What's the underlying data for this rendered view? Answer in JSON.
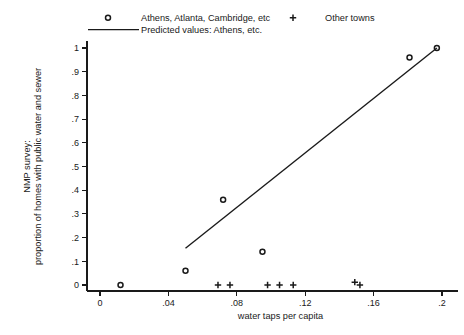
{
  "chart_data": {
    "type": "scatter",
    "title": "",
    "xlabel": "water taps per capita",
    "ylabel_line1": "NMP survey:",
    "ylabel_line2": "proportion of homes with public water and sewer",
    "xlim": [
      0,
      0.21
    ],
    "ylim": [
      0,
      1.05
    ],
    "xticks": [
      0,
      0.04,
      0.08,
      0.12,
      0.16,
      0.2
    ],
    "xticklabels": [
      "0",
      ".04",
      ".08",
      ".12",
      ".16",
      ".2"
    ],
    "yticks": [
      0,
      0.1,
      0.2,
      0.3,
      0.4,
      0.5,
      0.6,
      0.7,
      0.8,
      0.9,
      1
    ],
    "yticklabels": [
      "0",
      ".1",
      ".2",
      ".3",
      ".4",
      ".5",
      ".6",
      ".7",
      ".8",
      ".9",
      "1"
    ],
    "grid": false,
    "legend_position": "top",
    "series": [
      {
        "name": "Athens, Atlanta, Cambridge, etc",
        "marker": "circle",
        "points": [
          {
            "x": 0.012,
            "y": 0.0
          },
          {
            "x": 0.05,
            "y": 0.06
          },
          {
            "x": 0.072,
            "y": 0.36
          },
          {
            "x": 0.095,
            "y": 0.14
          },
          {
            "x": 0.181,
            "y": 0.96
          },
          {
            "x": 0.197,
            "y": 1.0
          }
        ]
      },
      {
        "name": "Other towns",
        "marker": "plus",
        "points": [
          {
            "x": 0.069,
            "y": 0.0
          },
          {
            "x": 0.076,
            "y": 0.0
          },
          {
            "x": 0.098,
            "y": 0.0
          },
          {
            "x": 0.105,
            "y": 0.0
          },
          {
            "x": 0.113,
            "y": 0.0
          },
          {
            "x": 0.149,
            "y": 0.012
          },
          {
            "x": 0.152,
            "y": 0.0
          }
        ]
      },
      {
        "name": "Predicted values: Athens, etc.",
        "marker": "line",
        "points": [
          {
            "x": 0.05,
            "y": 0.155
          },
          {
            "x": 0.197,
            "y": 1.0
          }
        ]
      }
    ]
  },
  "legend": {
    "entries": [
      {
        "label": "Athens, Atlanta, Cambridge, etc",
        "marker": "circle"
      },
      {
        "label": "Other towns",
        "marker": "plus"
      },
      {
        "label": "Predicted values: Athens, etc.",
        "marker": "line"
      }
    ]
  }
}
